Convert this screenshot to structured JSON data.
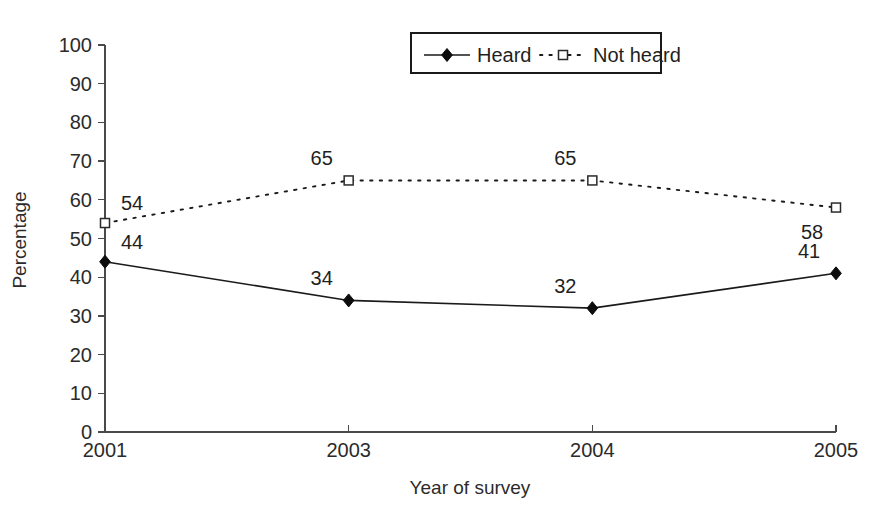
{
  "chart_data": {
    "type": "line",
    "title": "",
    "xlabel": "Year of survey",
    "ylabel": "Percentage",
    "categories": [
      "2001",
      "2003",
      "2004",
      "2005"
    ],
    "x": [
      2001,
      2003,
      2004,
      2005
    ],
    "ylim": [
      0,
      100
    ],
    "yticks": [
      "0",
      "10",
      "20",
      "30",
      "40",
      "50",
      "60",
      "70",
      "80",
      "90",
      "100"
    ],
    "ytick_values": [
      0,
      10,
      20,
      30,
      40,
      50,
      60,
      70,
      80,
      90,
      100
    ],
    "grid": false,
    "legend_position": "top-center",
    "series": [
      {
        "name": "Heard",
        "values": [
          44,
          34,
          32,
          41
        ],
        "marker": "filled-diamond",
        "linestyle": "solid",
        "color": "#1a1a1a",
        "point_labels": [
          "44",
          "34",
          "32",
          "41"
        ],
        "label_placement": [
          "above-right",
          "above-left",
          "above-left",
          "above-left"
        ]
      },
      {
        "name": "Not heard",
        "values": [
          54,
          65,
          65,
          58
        ],
        "marker": "open-square",
        "linestyle": "dotted",
        "color": "#1a1a1a",
        "point_labels": [
          "54",
          "65",
          "65",
          "58"
        ],
        "label_placement": [
          "above-right",
          "above-left",
          "above-left",
          "below-left"
        ]
      }
    ]
  },
  "legend": {
    "entries": [
      {
        "label": "Heard",
        "marker": "filled-diamond",
        "linestyle": "solid"
      },
      {
        "label": "Not heard",
        "marker": "open-square",
        "linestyle": "dotted"
      }
    ]
  },
  "axes": {
    "y_title": "Percentage",
    "x_title": "Year of survey",
    "y_tick_labels": [
      "100",
      "90",
      "80",
      "70",
      "60",
      "50",
      "40",
      "30",
      "20",
      "10",
      "0"
    ],
    "x_tick_labels": [
      "2001",
      "2003",
      "2004",
      "2005"
    ]
  },
  "colors": {
    "axis": "#4a4a4a",
    "text": "#1f1f1f",
    "series": "#1a1a1a",
    "background": "#ffffff"
  }
}
